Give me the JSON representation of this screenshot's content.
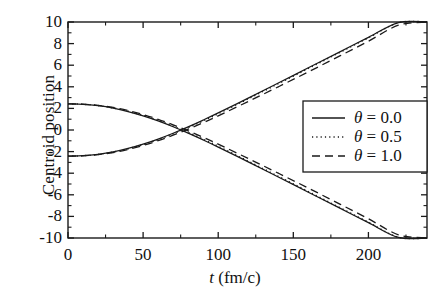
{
  "chart_data": {
    "type": "line",
    "title": "",
    "xlabel": "t (fm/c)",
    "xlabel_symbol": "t",
    "xlabel_unit": "(fm/c)",
    "ylabel": "Centroid position",
    "xlim": [
      0,
      239
    ],
    "ylim": [
      -10,
      10
    ],
    "grid": false,
    "x_ticks": [
      0,
      50,
      100,
      150,
      200
    ],
    "x_tick_labels": [
      "0",
      "50",
      "100",
      "150",
      "200"
    ],
    "x_minor_tick_step": 25,
    "y_ticks": [
      -10,
      -8,
      -6,
      -4,
      -2,
      0,
      2,
      4,
      6,
      8,
      10
    ],
    "y_tick_labels": [
      "10",
      "8",
      "6",
      "4",
      "2",
      "0",
      "-2",
      "-4",
      "-6",
      "-8",
      "-10"
    ],
    "y_minor_tick_step": 1,
    "legend_position": "center-right",
    "series": [
      {
        "name": "theta = 0.0",
        "label": "θ = 0.0",
        "theta": 0.0,
        "style": "solid",
        "color": "#1a1a1a",
        "branches": [
          {
            "branch": "upper",
            "x": [
              0,
              10,
              20,
              30,
              40,
              50,
              60,
              70,
              80,
              90,
              100,
              120,
              140,
              160,
              180,
              200,
              220,
              239
            ],
            "y": [
              2.42,
              2.38,
              2.25,
              2.03,
              1.71,
              1.31,
              0.84,
              0.3,
              -0.29,
              -0.92,
              -1.58,
              -2.95,
              -4.35,
              -5.76,
              -7.17,
              -8.58,
              -9.95,
              -10.0
            ]
          },
          {
            "branch": "lower",
            "x": [
              0,
              10,
              20,
              30,
              40,
              50,
              60,
              70,
              80,
              90,
              100,
              120,
              140,
              160,
              180,
              200,
              220,
              239
            ],
            "y": [
              -2.42,
              -2.38,
              -2.25,
              -2.03,
              -1.71,
              -1.31,
              -0.84,
              -0.3,
              0.29,
              0.92,
              1.58,
              2.95,
              4.35,
              5.76,
              7.17,
              8.58,
              9.95,
              10.0
            ]
          }
        ]
      },
      {
        "name": "theta = 0.5",
        "label": "θ = 0.5",
        "theta": 0.5,
        "style": "dotted",
        "color": "#1a1a1a",
        "branches": [
          {
            "branch": "upper",
            "x": [
              0,
              10,
              20,
              30,
              40,
              50,
              60,
              70,
              80,
              90,
              100,
              120,
              140,
              160,
              180,
              200,
              220,
              239
            ],
            "y": [
              2.42,
              2.38,
              2.26,
              2.05,
              1.74,
              1.35,
              0.89,
              0.36,
              -0.22,
              -0.85,
              -1.51,
              -2.89,
              -4.29,
              -5.7,
              -7.12,
              -8.54,
              -9.93,
              -10.0
            ]
          },
          {
            "branch": "lower",
            "x": [
              0,
              10,
              20,
              30,
              40,
              50,
              60,
              70,
              80,
              90,
              100,
              120,
              140,
              160,
              180,
              200,
              220,
              239
            ],
            "y": [
              -2.42,
              -2.38,
              -2.26,
              -2.05,
              -1.74,
              -1.35,
              -0.89,
              -0.36,
              0.22,
              0.85,
              1.51,
              2.89,
              4.29,
              5.7,
              7.12,
              8.54,
              9.93,
              10.0
            ]
          }
        ]
      },
      {
        "name": "theta = 1.0",
        "label": "θ = 1.0",
        "theta": 1.0,
        "style": "dashed",
        "color": "#1a1a1a",
        "branches": [
          {
            "branch": "upper",
            "x": [
              0,
              10,
              20,
              30,
              40,
              50,
              60,
              70,
              80,
              90,
              100,
              120,
              140,
              160,
              180,
              200,
              220,
              239
            ],
            "y": [
              2.42,
              2.39,
              2.28,
              2.09,
              1.8,
              1.43,
              0.99,
              0.48,
              -0.08,
              -0.68,
              -1.31,
              -2.64,
              -4.0,
              -5.38,
              -6.79,
              -8.22,
              -9.7,
              -10.0
            ]
          },
          {
            "branch": "lower",
            "x": [
              0,
              10,
              20,
              30,
              40,
              50,
              60,
              70,
              80,
              90,
              100,
              120,
              140,
              160,
              180,
              200,
              220,
              239
            ],
            "y": [
              -2.42,
              -2.39,
              -2.28,
              -2.09,
              -1.8,
              -1.43,
              -0.99,
              -0.48,
              0.08,
              0.68,
              1.31,
              2.64,
              4.0,
              5.38,
              6.79,
              8.22,
              9.7,
              10.0
            ]
          }
        ]
      }
    ]
  },
  "axes": {
    "ylabel": "Centroid position",
    "xlabel_symbol": "t",
    "xlabel_unit": "(fm/c)",
    "y_tick_labels": [
      "10",
      "8",
      "6",
      "4",
      "2",
      "0",
      "-2",
      "-4",
      "-6",
      "-8",
      "-10"
    ],
    "x_tick_labels": [
      "0",
      "50",
      "100",
      "150",
      "200"
    ]
  },
  "legend": {
    "entries": [
      {
        "label": "θ = 0.0",
        "symbol": "θ",
        "value": "= 0.0",
        "style": "solid"
      },
      {
        "label": "θ = 0.5",
        "symbol": "θ",
        "value": "= 0.5",
        "style": "dotted"
      },
      {
        "label": "θ = 1.0",
        "symbol": "θ",
        "value": "= 1.0",
        "style": "dashed"
      }
    ]
  },
  "colors": {
    "line": "#1a1a1a",
    "axis": "#1a1a1a",
    "background": "#ffffff"
  }
}
